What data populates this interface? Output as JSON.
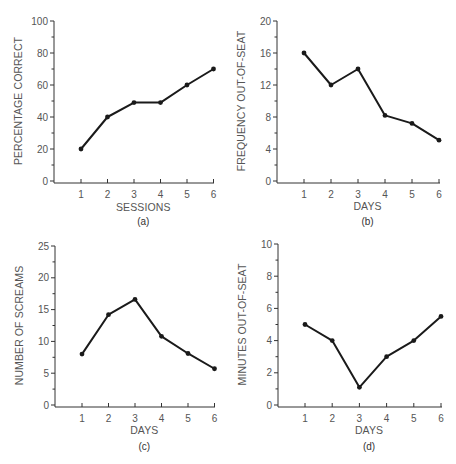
{
  "chart_data": [
    {
      "id": "a",
      "type": "line",
      "panel_label": "(a)",
      "title": "",
      "xlabel": "SESSIONS",
      "ylabel": "PERCENTAGE CORRECT",
      "x": [
        1,
        2,
        3,
        4,
        5,
        6
      ],
      "values": [
        20,
        40,
        49,
        49,
        60,
        70
      ],
      "ylim": [
        0,
        100
      ],
      "yticks": [
        0,
        20,
        40,
        60,
        80,
        100
      ],
      "yminor": [
        10,
        30,
        50,
        70,
        90
      ],
      "grid": false,
      "legend": null,
      "layout": {
        "axis_x": 54,
        "x0": 81,
        "dx": 26.5,
        "y0": 181,
        "ytop": 21,
        "xend": 214,
        "xlabel_y": 211,
        "panel_y": 225
      }
    },
    {
      "id": "b",
      "type": "line",
      "panel_label": "(b)",
      "title": "",
      "xlabel": "DAYS",
      "ylabel": "FREQUENCY OUT-OF-SEAT",
      "x": [
        1,
        2,
        3,
        4,
        5,
        6
      ],
      "values": [
        16,
        12,
        14,
        8.2,
        7.2,
        5.1
      ],
      "ylim": [
        0,
        20
      ],
      "yticks": [
        0,
        4,
        8,
        12,
        16,
        20
      ],
      "yminor": [
        2,
        6,
        10,
        14,
        18
      ],
      "grid": false,
      "legend": null,
      "layout": {
        "axis_x": 277,
        "x0": 304,
        "dx": 27,
        "y0": 181,
        "ytop": 21,
        "xend": 440,
        "xlabel_y": 210,
        "panel_y": 225
      }
    },
    {
      "id": "c",
      "type": "line",
      "panel_label": "(c)",
      "title": "",
      "xlabel": "DAYS",
      "ylabel": "NUMBER OF SCREAMS",
      "x": [
        1,
        2,
        3,
        4,
        5,
        6
      ],
      "values": [
        8,
        14.2,
        16.6,
        10.8,
        8.1,
        5.7
      ],
      "ylim": [
        0,
        25
      ],
      "yticks": [
        0,
        5,
        10,
        15,
        20,
        25
      ],
      "yminor": [
        2.5,
        7.5,
        12.5,
        17.5,
        22.5
      ],
      "grid": false,
      "legend": null,
      "layout": {
        "axis_x": 55,
        "x0": 82,
        "dx": 26.5,
        "y0": 405,
        "ytop": 246,
        "xend": 215,
        "xlabel_y": 434,
        "panel_y": 450
      }
    },
    {
      "id": "d",
      "type": "line",
      "panel_label": "(d)",
      "title": "",
      "xlabel": "DAYS",
      "ylabel": "MINUTES OUT-OF-SEAT",
      "x": [
        1,
        2,
        3,
        4,
        5,
        6
      ],
      "values": [
        5,
        4,
        1.1,
        3,
        4,
        5.5
      ],
      "ylim": [
        0,
        10
      ],
      "yticks": [
        0,
        2,
        4,
        6,
        8,
        10
      ],
      "yminor": [
        1,
        3,
        5,
        7,
        9
      ],
      "grid": false,
      "legend": null,
      "layout": {
        "axis_x": 278,
        "x0": 305,
        "dx": 27.2,
        "y0": 405,
        "ytop": 244,
        "xend": 442,
        "xlabel_y": 434,
        "panel_y": 450
      }
    }
  ]
}
